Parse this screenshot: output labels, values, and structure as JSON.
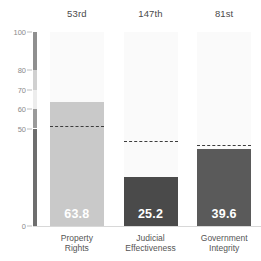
{
  "chart_data": {
    "type": "bar",
    "title": "",
    "subtitle": "",
    "xlabel": "",
    "ylabel": "",
    "ylim": [
      0,
      100
    ],
    "grid": false,
    "legend": "none",
    "categories": [
      "Property Rights",
      "Judicial Effectiveness",
      "Government Integrity"
    ],
    "values": [
      63.8,
      25.2,
      39.6
    ],
    "value_labels": [
      "63.8",
      "25.2",
      "39.6"
    ],
    "ranks": [
      "53rd",
      "147th",
      "81st"
    ],
    "world_average_markers": [
      51.0,
      43.0,
      41.0
    ],
    "marker_style": "dashed",
    "yticks": [
      0,
      50,
      60,
      70,
      80,
      100
    ],
    "ytick_labels": [
      "0",
      "50",
      "60",
      "70",
      "80",
      "100"
    ],
    "bar_colors": [
      "#c9c9c9",
      "#4a4a4a",
      "#5a5a5a"
    ],
    "track_color": "#fafafa",
    "value_label_color": "#ffffff",
    "marker_color": "#3d3d3d"
  },
  "axis": {
    "rail_segments": [
      {
        "from": 100,
        "to": 80,
        "color": "#8f8f8f"
      },
      {
        "from": 80,
        "to": 70,
        "color": "#d0d0d0"
      },
      {
        "from": 70,
        "to": 60,
        "color": "#ededed"
      },
      {
        "from": 60,
        "to": 50,
        "color": "#9a9a9a"
      },
      {
        "from": 50,
        "to": 0,
        "color": "#6e6e6e"
      }
    ],
    "baseline_color": "#d8d8d8",
    "tick_color": "#bdbdbd",
    "tick_text_color": "#8a8a8a"
  },
  "category_label_lines": [
    [
      "Property",
      "Rights"
    ],
    [
      "Judicial",
      "Effectiveness"
    ],
    [
      "Government",
      "Integrity"
    ]
  ]
}
